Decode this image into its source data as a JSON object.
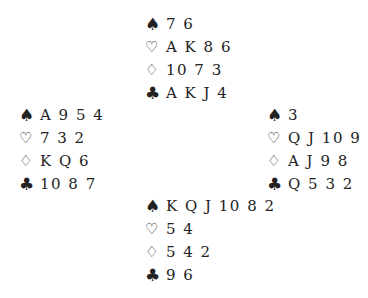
{
  "suit_symbols": {
    "spades": "♠",
    "hearts": "♡",
    "diamonds": "♢",
    "clubs": "♣"
  },
  "hands": {
    "north": {
      "spades": "7 6",
      "hearts": "A K 8 6",
      "diamonds": "10 7 3",
      "clubs": "A K J 4"
    },
    "west": {
      "spades": "A 9 5 4",
      "hearts": "7 3 2",
      "diamonds": "K Q 6",
      "clubs": "10 8 7"
    },
    "east": {
      "spades": "3",
      "hearts": "Q J 10 9",
      "diamonds": "A J 9 8",
      "clubs": "Q 5 3 2"
    },
    "south": {
      "spades": "K Q J 10 8 2",
      "hearts": "5 4",
      "diamonds": "5 4 2",
      "clubs": "9 6"
    }
  }
}
